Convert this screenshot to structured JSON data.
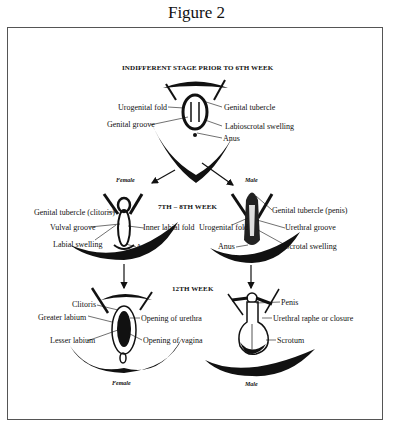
{
  "title": "Figure 2",
  "stages": {
    "indifferent": {
      "heading": "INDIFFERENT STAGE PRIOR TO 6TH WEEK",
      "labels": {
        "urogenital_fold": "Urogenital fold",
        "genital_tubercle": "Genital tubercle",
        "genital_groove": "Genital groove",
        "labioscrotal_swelling": "Labioscrotal swelling",
        "anus": "Anus"
      }
    },
    "week7_8": {
      "heading": "7TH – 8TH WEEK",
      "female": {
        "caption": "Female",
        "labels": {
          "genital_tubercle": "Genital tubercle (clitoris)",
          "vulval_groove": "Vulval groove",
          "labial_swelling": "Labial swelling",
          "inner_labial_fold": "Inner labial fold",
          "anus": "Anus"
        }
      },
      "male": {
        "caption": "Male",
        "labels": {
          "genital_tubercle": "Genital tubercle (penis)",
          "urogenital_fold": "Urogenital fold",
          "urethral_groove": "Urethral groove",
          "anus": "Anus",
          "scrotal_swelling": "Scrotal swelling"
        }
      }
    },
    "week12": {
      "heading": "12TH WEEK",
      "female": {
        "caption": "Female",
        "labels": {
          "clitoris": "Clitoris",
          "greater_labium": "Greater labium",
          "lesser_labium": "Lesser labium",
          "opening_urethra": "Opening of urethra",
          "opening_vagina": "Opening of vagina"
        }
      },
      "male": {
        "caption": "Male",
        "labels": {
          "penis": "Penis",
          "urethral_raphe": "Urethral raphe or closure",
          "scrotum": "Scrotum"
        }
      }
    }
  }
}
